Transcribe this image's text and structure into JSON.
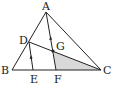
{
  "diagram": {
    "type": "geometry-triangle",
    "points": {
      "A": {
        "label": "A",
        "x": 46,
        "y": 12
      },
      "B": {
        "label": "B",
        "x": 12,
        "y": 70
      },
      "C": {
        "label": "C",
        "x": 101,
        "y": 70
      },
      "D": {
        "label": "D",
        "x": 29,
        "y": 42
      },
      "E": {
        "label": "E",
        "x": 33,
        "y": 70
      },
      "F": {
        "label": "F",
        "x": 56,
        "y": 70
      },
      "G": {
        "label": "G",
        "x": 53,
        "y": 51
      }
    },
    "segments": [
      "AB",
      "BC",
      "CA",
      "DC",
      "DE",
      "AF"
    ],
    "parallel_marks": [
      "DE",
      "AF"
    ],
    "shaded_region": [
      "G",
      "F",
      "C"
    ],
    "shade_color": "#d9d9d9",
    "line_color": "#222222"
  }
}
